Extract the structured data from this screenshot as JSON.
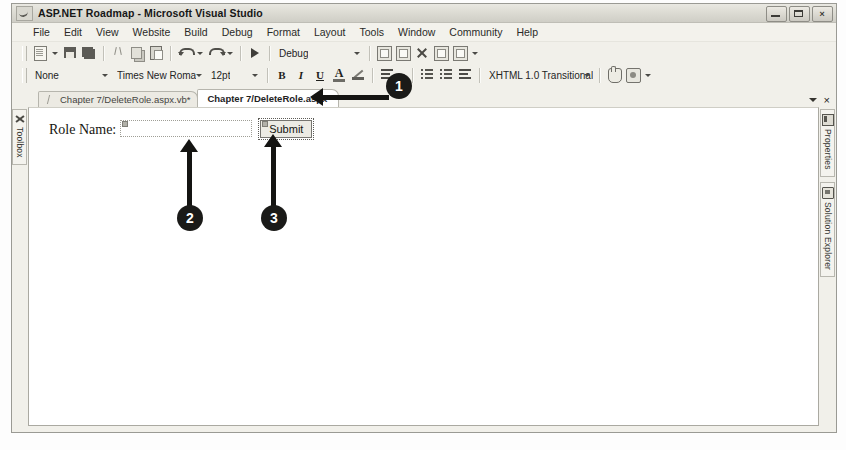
{
  "window": {
    "title": "ASP.NET Roadmap - Microsoft Visual Studio",
    "app_icon": "visual-studio-icon",
    "controls": {
      "minimize": "minimize-icon",
      "maximize": "restore-icon",
      "close": "×"
    }
  },
  "menu": {
    "items": [
      {
        "label": "File"
      },
      {
        "label": "Edit"
      },
      {
        "label": "View"
      },
      {
        "label": "Website"
      },
      {
        "label": "Build"
      },
      {
        "label": "Debug"
      },
      {
        "label": "Format"
      },
      {
        "label": "Layout"
      },
      {
        "label": "Tools"
      },
      {
        "label": "Window"
      },
      {
        "label": "Community"
      },
      {
        "label": "Help"
      }
    ]
  },
  "standard_toolbar": {
    "buttons": [
      {
        "name": "new-project-button",
        "icon": "new-page-icon"
      },
      {
        "name": "save-button",
        "icon": "save-icon"
      },
      {
        "name": "save-all-button",
        "icon": "save-all-icon"
      },
      {
        "name": "cut-button",
        "icon": "scissors-icon"
      },
      {
        "name": "copy-button",
        "icon": "copy-icon"
      },
      {
        "name": "paste-button",
        "icon": "paste-icon"
      },
      {
        "name": "undo-button",
        "icon": "undo-icon"
      },
      {
        "name": "redo-button",
        "icon": "redo-icon"
      },
      {
        "name": "start-debugging-button",
        "icon": "play-icon"
      }
    ],
    "configuration": {
      "value": "Debug",
      "name": "solution-configuration-dropdown"
    },
    "extra_buttons": [
      {
        "name": "find-in-files-button",
        "icon": "find-icon"
      },
      {
        "name": "new-item-button",
        "icon": "new-item-icon"
      },
      {
        "name": "tools-button",
        "icon": "tools-icon"
      },
      {
        "name": "solution-explorer-button",
        "icon": "solution-explorer-icon"
      },
      {
        "name": "properties-window-button",
        "icon": "properties-icon"
      }
    ]
  },
  "formatting_toolbar": {
    "block_format": {
      "value": "None",
      "name": "block-format-dropdown"
    },
    "font_family": {
      "value": "Times New Roma",
      "name": "font-family-dropdown"
    },
    "font_size": {
      "value": "12pt",
      "name": "font-size-dropdown"
    },
    "bold": "B",
    "italic": "I",
    "underline": "U",
    "foreground_color": "A",
    "doctype": {
      "value": "XHTML 1.0 Transitional",
      "name": "target-schema-dropdown"
    }
  },
  "document_tabs": [
    {
      "label": "Chapter 7/DeleteRole.aspx.vb*",
      "active": false,
      "name": "tab-delete-role-aspx-vb"
    },
    {
      "label": "Chapter 7/DeleteRole.aspx*",
      "active": true,
      "name": "tab-delete-role-aspx"
    }
  ],
  "tabstrip_controls": {
    "dropdown": "chevron-down-icon",
    "close": "×"
  },
  "left_rail": [
    {
      "label": "Toolbox",
      "icon": "toolbox-icon",
      "name": "rail-tab-toolbox"
    }
  ],
  "right_rail": [
    {
      "label": "Properties",
      "icon": "properties-icon",
      "name": "rail-tab-properties"
    },
    {
      "label": "Solution Explorer",
      "icon": "solution-explorer-icon",
      "name": "rail-tab-solution-explorer"
    }
  ],
  "design_surface": {
    "role_name_label": "Role Name:",
    "role_name_value": "",
    "submit_button_label": "Submit"
  },
  "callouts": [
    {
      "number": "1",
      "points_to": "active-document-tab",
      "direction": "left"
    },
    {
      "number": "2",
      "points_to": "role-name-textbox",
      "direction": "up"
    },
    {
      "number": "3",
      "points_to": "submit-button",
      "direction": "up"
    }
  ]
}
